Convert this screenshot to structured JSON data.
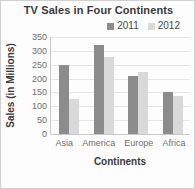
{
  "chart_data": {
    "type": "bar",
    "title": "TV Sales in Four Continents",
    "xlabel": "Continents",
    "ylabel": "Sales (in Millions)",
    "categories": [
      "Asia",
      "America",
      "Europe",
      "Africa"
    ],
    "series": [
      {
        "name": "2011",
        "color": "#8c8c8c",
        "values": [
          250,
          320,
          210,
          150
        ]
      },
      {
        "name": "2012",
        "color": "#d9d9d9",
        "values": [
          127,
          278,
          225,
          138
        ]
      }
    ],
    "ylim": [
      0,
      350
    ],
    "yticks": [
      0,
      50,
      100,
      150,
      200,
      250,
      300,
      350
    ],
    "ytick_labels": [
      "0",
      "50",
      "100",
      "150",
      "200",
      "250",
      "300",
      "350"
    ],
    "grid": "horizontal",
    "legend_position": "top-right",
    "legend_orientation": "horizontal"
  },
  "colors": {
    "series_2011": "#8c8c8c",
    "series_2012": "#d9d9d9",
    "gridline": "#e4e4e4",
    "axis": "#c8c8c8",
    "title_text": "#3a3a3a",
    "tick_text": "#6e6e6e",
    "border": "#d0d0d0",
    "background": "#fdfdfd"
  }
}
